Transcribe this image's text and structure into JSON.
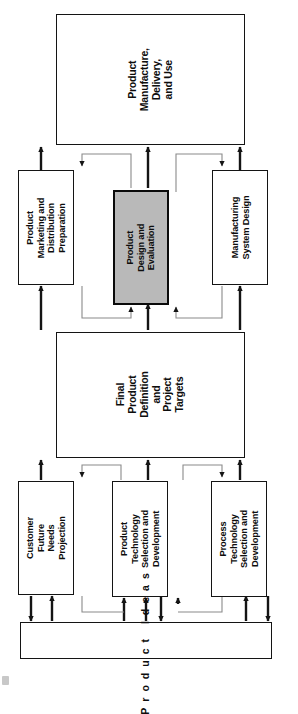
{
  "diagram": {
    "orientation": "rotated-90-ccw",
    "colors": {
      "line": "#141414",
      "thin_line": "#8a8a8a",
      "shaded_fill": "#b9b9b9",
      "background": "#ffffff",
      "text": "#0d0d0d"
    },
    "nodes": {
      "product_manufacture": "Product\nManufacture,\nDelivery,\nand Use",
      "product_marketing": "Product\nMarketing and\nDistribution\nPreparation",
      "product_design": "Product\nDesign and\nEvaluation",
      "manufacturing_system": "Manufacturing\nSystem Design",
      "final_product": "Final\nProduct\nDefinition\nand\nProject\nTargets",
      "customer_needs": "Customer\nFuture\nNeeds\nProjection",
      "product_technology": "Product\nTechnology\nSelection and\nDevelopment",
      "process_technology": "Process\nTechnology\nSelection and\nDevelopment",
      "product_ideas": "Product Ideas"
    }
  }
}
